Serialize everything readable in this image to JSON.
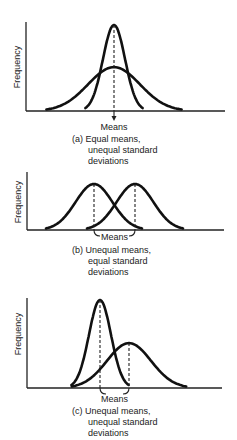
{
  "figure": {
    "panels": [
      {
        "id": "a",
        "ylabel": "Frequency",
        "means_label": "Means",
        "caption_lines": [
          "(a)  Equal means,",
          "unequal standard",
          "deviations"
        ],
        "curves": [
          {
            "name": "narrow",
            "mean": 0.0,
            "sd": 0.55,
            "peak": 1.0
          },
          {
            "name": "wide",
            "mean": 0.0,
            "sd": 1.3,
            "peak": 0.51
          }
        ]
      },
      {
        "id": "b",
        "ylabel": "Frequency",
        "means_label": "Means",
        "caption_lines": [
          "(b)  Unequal means,",
          "equal standard",
          "deviations"
        ],
        "curves": [
          {
            "name": "left",
            "mean": -1.0,
            "sd": 0.9,
            "peak": 0.78
          },
          {
            "name": "right",
            "mean": 1.0,
            "sd": 0.9,
            "peak": 0.78
          }
        ]
      },
      {
        "id": "c",
        "ylabel": "Frequency",
        "means_label": "Means",
        "caption_lines": [
          "(c)  Unequal means,",
          "unequal standard",
          "deviations"
        ],
        "curves": [
          {
            "name": "narrow",
            "mean": -0.7,
            "sd": 0.55,
            "peak": 1.0
          },
          {
            "name": "wide",
            "mean": 0.75,
            "sd": 1.1,
            "peak": 0.51
          }
        ]
      }
    ]
  }
}
